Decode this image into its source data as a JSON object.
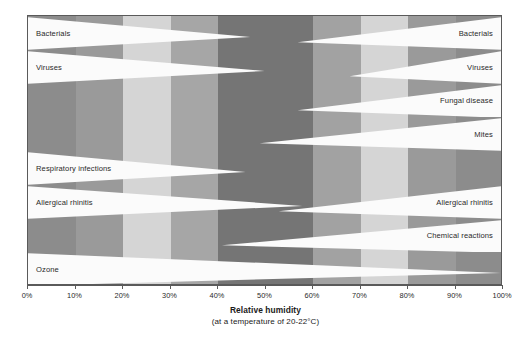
{
  "chart_data": {
    "type": "bar",
    "title": "Relative humidity",
    "subtitle": "(at a temperature of 20-22°C)",
    "xlabel": "Relative humidity",
    "ylabel": "",
    "xlim": [
      0,
      100
    ],
    "grid": false,
    "legend": "none",
    "tick_labels": [
      "0%",
      "10%",
      "20%",
      "30%",
      "40%",
      "50%",
      "60%",
      "70%",
      "80%",
      "90%",
      "100%"
    ],
    "tick_values": [
      0,
      10,
      20,
      30,
      40,
      50,
      60,
      70,
      80,
      90,
      100
    ],
    "background_columns": [
      {
        "from": 0,
        "to": 10,
        "color": "#8c8c8c"
      },
      {
        "from": 10,
        "to": 20,
        "color": "#9a9a9a"
      },
      {
        "from": 20,
        "to": 30,
        "color": "#d5d5d5"
      },
      {
        "from": 30,
        "to": 40,
        "color": "#a6a6a6"
      },
      {
        "from": 40,
        "to": 60,
        "color": "#757575"
      },
      {
        "from": 60,
        "to": 70,
        "color": "#a2a2a2"
      },
      {
        "from": 70,
        "to": 80,
        "color": "#d5d5d5"
      },
      {
        "from": 80,
        "to": 90,
        "color": "#9a9a9a"
      },
      {
        "from": 90,
        "to": 100,
        "color": "#8c8c8c"
      }
    ],
    "bands": [
      {
        "name": "bacterials",
        "label_left": "Bacterials",
        "label_right": "Bacterials",
        "left_wedge": {
          "from": 0,
          "to": 47
        },
        "right_wedge": {
          "from": 57,
          "to": 100
        }
      },
      {
        "name": "viruses",
        "label_left": "Viruses",
        "label_right": "Viruses",
        "left_wedge": {
          "from": 0,
          "to": 50
        },
        "right_wedge": {
          "from": 68,
          "to": 100
        }
      },
      {
        "name": "fungal-disease",
        "label_left": "",
        "label_right": "Fungal disease",
        "left_wedge": null,
        "right_wedge": {
          "from": 57,
          "to": 100
        }
      },
      {
        "name": "mites",
        "label_left": "",
        "label_right": "Mites",
        "left_wedge": null,
        "right_wedge": {
          "from": 49,
          "to": 100
        }
      },
      {
        "name": "respiratory-infections",
        "label_left": "Respiratory infections",
        "label_right": "",
        "left_wedge": {
          "from": 0,
          "to": 46
        },
        "right_wedge": null
      },
      {
        "name": "allergical-rhinitis",
        "label_left": "Allergical rhinitis",
        "label_right": "Allergical rhinitis",
        "left_wedge": {
          "from": 0,
          "to": 58
        },
        "right_wedge": {
          "from": 53,
          "to": 100
        }
      },
      {
        "name": "chemical-reactions",
        "label_left": "",
        "label_right": "Chemical reactions",
        "left_wedge": null,
        "right_wedge": {
          "from": 41,
          "to": 100
        }
      },
      {
        "name": "ozone",
        "label_left": "Ozone",
        "label_right": "",
        "left_wedge": {
          "from": 0,
          "to": 100
        },
        "right_wedge": null
      }
    ],
    "colors": {
      "wedge": "#fbfbfb",
      "border": "#5a5a5a",
      "text": "#2a2a2a"
    }
  },
  "axis": {
    "title": "Relative humidity",
    "subtitle": "(at a temperature of 20-22°C)"
  }
}
